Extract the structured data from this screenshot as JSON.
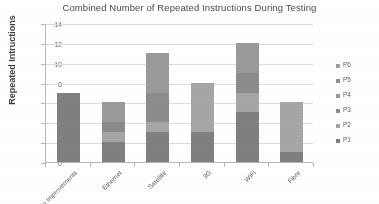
{
  "chart_data": {
    "type": "bar",
    "subtype": "stacked-column",
    "title": "Combined Number of Repeated Instructions During Testing",
    "xlabel": "",
    "ylabel": "Repeated Intructions",
    "ylim": [
      0,
      14
    ],
    "ytick_step": 2,
    "yticks": [
      0,
      2,
      4,
      6,
      8,
      10,
      12,
      14
    ],
    "grid": true,
    "legend_position": "right",
    "categories": [
      "No Improvements",
      "Ethernet",
      "Satellite",
      "3G",
      "WiFi",
      "Fibre"
    ],
    "series": [
      {
        "name": "P1",
        "color": "#808080",
        "values": [
          7,
          2,
          3,
          3,
          5,
          1
        ]
      },
      {
        "name": "P2",
        "color": "#a6a6a6",
        "values": [
          0,
          1,
          1,
          5,
          2,
          5
        ]
      },
      {
        "name": "P3",
        "color": "#8c8c8c",
        "values": [
          0,
          1,
          3,
          0,
          2,
          0
        ]
      },
      {
        "name": "P4",
        "color": "#9a9a9a",
        "values": [
          0,
          2,
          4,
          0,
          3,
          0
        ]
      },
      {
        "name": "P5",
        "color": "#8f8f8f",
        "values": [
          0,
          0,
          0,
          0,
          0,
          0
        ]
      },
      {
        "name": "P6",
        "color": "#9e9e9e",
        "values": [
          0,
          0,
          0,
          0,
          0,
          0
        ]
      }
    ],
    "totals": [
      7,
      6,
      11,
      8,
      12,
      6
    ],
    "legend_order": [
      "P6",
      "P5",
      "P4",
      "P3",
      "P2",
      "P1"
    ]
  },
  "colors": {
    "axis": "#b6b6b6",
    "gridline": "#dcdcdc",
    "title_text": "#4a4a4a",
    "tick_text": "#6a6a6a",
    "background": "#ffffff"
  }
}
